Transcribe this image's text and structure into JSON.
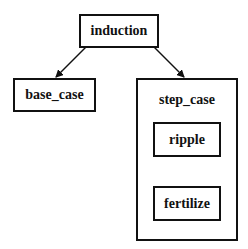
{
  "diagram": {
    "nodes": {
      "induction": {
        "label": "induction"
      },
      "base_case": {
        "label": "base_case"
      },
      "step_case": {
        "label": "step_case"
      },
      "ripple": {
        "label": "ripple"
      },
      "fertilize": {
        "label": "fertilize"
      }
    },
    "edges": [
      {
        "from": "induction",
        "to": "base_case"
      },
      {
        "from": "induction",
        "to": "step_case"
      },
      {
        "from": "ripple",
        "to": "fertilize"
      }
    ],
    "groups": [
      {
        "name": "step_case",
        "contains": [
          "ripple",
          "fertilize"
        ]
      }
    ]
  }
}
